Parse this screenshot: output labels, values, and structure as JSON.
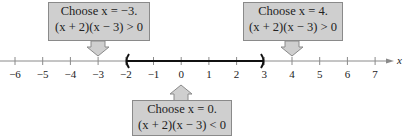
{
  "number_line": {
    "variable": "x",
    "min": -6,
    "max": 7,
    "ticks": [
      "−6",
      "−5",
      "−4",
      "−3",
      "−2",
      "−1",
      "0",
      "1",
      "2",
      "3",
      "4",
      "5",
      "6",
      "7"
    ],
    "interval": {
      "start": -2,
      "end": 3,
      "left_bracket": "(",
      "right_bracket": ")"
    }
  },
  "callouts": [
    {
      "id": "left",
      "line1": "Choose x = −3.",
      "line2": "(x + 2)(x − 3) > 0",
      "points_to": -3
    },
    {
      "id": "middle",
      "line1": "Choose x = 0.",
      "line2": "(x + 2)(x − 3) < 0",
      "points_to": 0
    },
    {
      "id": "right",
      "line1": "Choose x = 4.",
      "line2": "(x + 2)(x − 3) > 0",
      "points_to": 4
    }
  ],
  "colors": {
    "box_fill": "#cfcfcf",
    "box_border": "#8a8a8a",
    "axis": "#888888",
    "interval": "#111111"
  }
}
